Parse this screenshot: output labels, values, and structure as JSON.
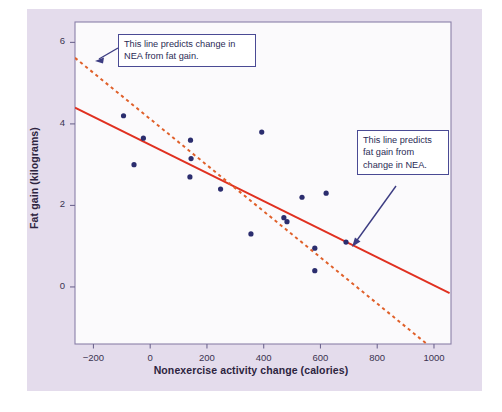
{
  "figure": {
    "background_color": "#e4dcec",
    "plot_background_color": "#fbfafc",
    "frame_color": "#8a80a8"
  },
  "annotations": [
    {
      "name": "annotation-nea-from-fat",
      "text": "This line predicts change in NEA from fat gain.",
      "target_line": "dashed",
      "border_color": "#4a4a94"
    },
    {
      "name": "annotation-fat-from-nea",
      "text": "This line predicts fat gain from change in NEA.",
      "target_line": "solid",
      "border_color": "#4a4a94"
    }
  ],
  "chart_data": {
    "type": "scatter",
    "title": "",
    "xlabel": "Nonexercise activity change (calories)",
    "ylabel": "Fat gain (kilograms)",
    "xlim": [
      -265,
      1060
    ],
    "ylim": [
      -1.4,
      6.5
    ],
    "xticks": [
      -200,
      0,
      200,
      400,
      600,
      800,
      1000
    ],
    "xtick_labels": [
      "−200",
      "0",
      "200",
      "400",
      "600",
      "800",
      "1000"
    ],
    "yticks": [
      0,
      2,
      4,
      6
    ],
    "ytick_labels": [
      "0",
      "2",
      "4",
      "6"
    ],
    "grid": false,
    "legend": "none",
    "point_color": "#2b2d6e",
    "point_radius": 2.6,
    "x": [
      -94,
      -57,
      -24,
      142,
      144,
      140,
      248,
      355,
      393,
      471,
      482,
      535,
      580,
      580,
      620,
      690
    ],
    "y": [
      4.2,
      3.0,
      3.65,
      3.6,
      3.15,
      2.7,
      2.4,
      1.3,
      3.8,
      1.7,
      1.6,
      2.2,
      0.95,
      0.4,
      2.3,
      1.1
    ],
    "series": [
      {
        "name": "points",
        "values": [
          {
            "x": -94,
            "y": 4.2
          },
          {
            "x": -57,
            "y": 3.0
          },
          {
            "x": -24,
            "y": 3.65
          },
          {
            "x": 142,
            "y": 3.6
          },
          {
            "x": 144,
            "y": 3.15
          },
          {
            "x": 140,
            "y": 2.7
          },
          {
            "x": 248,
            "y": 2.4
          },
          {
            "x": 355,
            "y": 1.3
          },
          {
            "x": 393,
            "y": 3.8
          },
          {
            "x": 471,
            "y": 1.7
          },
          {
            "x": 482,
            "y": 1.6
          },
          {
            "x": 535,
            "y": 2.2
          },
          {
            "x": 580,
            "y": 0.95
          },
          {
            "x": 580,
            "y": 0.4
          },
          {
            "x": 620,
            "y": 2.3
          },
          {
            "x": 690,
            "y": 1.1
          }
        ]
      }
    ],
    "lines": [
      {
        "name": "fat-gain-on-nea",
        "style": "solid",
        "color": "#e03020",
        "x0": -265,
        "y0": 4.4,
        "x1": 1055,
        "y1": -0.15
      },
      {
        "name": "nea-on-fat-gain",
        "style": "dashed",
        "color": "#e0602a",
        "x0": -265,
        "y0": 5.62,
        "x1": 975,
        "y1": -1.4
      }
    ]
  }
}
